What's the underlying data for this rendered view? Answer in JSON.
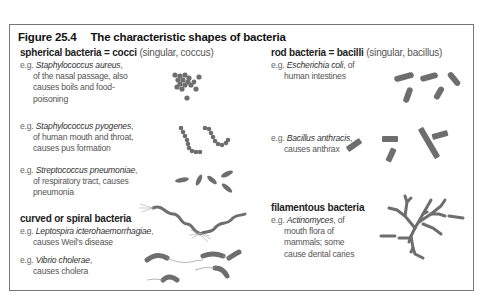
{
  "figure": {
    "number": "Figure 25.4",
    "title": "The characteristic shapes of bacteria"
  },
  "sections": {
    "spherical": {
      "heading_bold": "spherical bacteria = cocci",
      "heading_sub": "(singular, coccus)",
      "examples": [
        {
          "prefix": "e.g.",
          "species": "Staphylococcus aureus",
          "desc_lines": [
            "of the nasal passage, also",
            "causes boils and food-",
            "poisoning"
          ]
        },
        {
          "prefix": "e.g.",
          "species": "Staphylococcus pyogenes",
          "desc_lines": [
            "of human mouth and throat,",
            "causes pus formation"
          ]
        },
        {
          "prefix": "e.g.",
          "species": "Streptococcus pneumoniae",
          "desc_lines": [
            "of respiratory tract, causes",
            "pneumonia"
          ]
        }
      ]
    },
    "spiral": {
      "heading_bold": "curved or spiral bacteria",
      "examples": [
        {
          "prefix": "e.g.",
          "species": "Leptospira icterohaemorrhagiae",
          "desc_lines": [
            "causes Weil's disease"
          ]
        },
        {
          "prefix": "e.g.",
          "species": "Vibrio cholerae",
          "desc_lines": [
            "causes cholera"
          ]
        }
      ]
    },
    "rod": {
      "heading_bold": "rod bacteria = bacilli",
      "heading_sub": "(singular, bacillus)",
      "examples": [
        {
          "prefix": "e.g.",
          "species": "Escherichia coli",
          "desc_inline": "of",
          "desc_lines": [
            "human intestines"
          ]
        },
        {
          "prefix": "e.g.",
          "species": "Bacillus anthracis",
          "desc_lines": [
            "causes anthrax"
          ]
        }
      ]
    },
    "filamentous": {
      "heading_bold": "filamentous bacteria",
      "examples": [
        {
          "prefix": "e.g.",
          "species": "Actinomyces",
          "desc_inline": "of",
          "desc_lines": [
            "mouth flora of",
            "mammals; some",
            "cause dental caries"
          ]
        }
      ]
    }
  },
  "illustrations": [
    "staphylococcus-cluster",
    "streptococcus-chains",
    "diplococcus-pairs",
    "leptospira-spirals",
    "vibrio-curved-rods",
    "e-coli-rods",
    "bacillus-anthracis-rods",
    "actinomyces-filaments"
  ],
  "colors": {
    "bacteria_fill": "#6e6e6e",
    "frame_border": "#777777",
    "title_text": "#111111"
  }
}
